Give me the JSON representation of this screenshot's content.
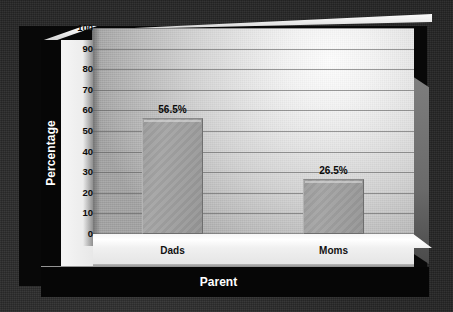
{
  "chart_data": {
    "type": "bar",
    "title": "",
    "xlabel": "Parent",
    "ylabel": "Percentage",
    "categories": [
      "Dads",
      "Moms"
    ],
    "values": [
      56.5,
      26.5
    ],
    "value_labels": [
      "56.5%",
      "26.5%"
    ],
    "ylim": [
      0,
      100
    ],
    "ytick_step": 10,
    "yticks": [
      100,
      90,
      80,
      70,
      60,
      50,
      40,
      30,
      20,
      10,
      0
    ],
    "ytick_labels": [
      "100",
      "90",
      "80",
      "70",
      "60",
      "50",
      "40",
      "30",
      "20",
      "10",
      "0"
    ],
    "grid": true,
    "grid_orientation": "horizontal",
    "legend": false,
    "legend_position": "none",
    "style": "3d-bar-chart",
    "colors": {
      "bar_fill": "#9e9e9e",
      "bar_border": "#6e6e6e",
      "plot_background": "#d8d8d8",
      "axis_band": "#060606",
      "axis_band_text": "#ffffff",
      "tick_text": "#0b0b0b",
      "outer_background": "#2c2c2c",
      "floor": "#f2f2f2",
      "gridline": "#606060"
    }
  }
}
